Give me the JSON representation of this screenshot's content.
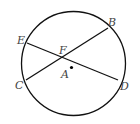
{
  "diagram": {
    "circle": {
      "cx": 73.5,
      "cy": 63.5,
      "r": 52
    },
    "center": {
      "label": "A",
      "x": 71.5,
      "y": 67.5
    },
    "points": {
      "E": {
        "x": 27,
        "y": 43
      },
      "B": {
        "x": 108,
        "y": 28
      },
      "C": {
        "x": 26,
        "y": 80
      },
      "D": {
        "x": 118,
        "y": 80
      },
      "F": {
        "x": 62,
        "y": 57
      }
    },
    "chords": [
      [
        "E",
        "D"
      ],
      [
        "C",
        "B"
      ]
    ],
    "labels": {
      "E": "E",
      "B": "B",
      "C": "C",
      "D": "D",
      "F": "F",
      "A": "A"
    }
  }
}
